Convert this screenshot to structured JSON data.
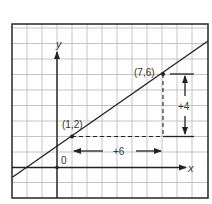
{
  "diagram": {
    "axes": {
      "x_label": "x",
      "y_label": "y",
      "origin_label": "0"
    },
    "points": [
      {
        "label": "(1,2)",
        "x": 1,
        "y": 2
      },
      {
        "label": "(7,6)",
        "x": 7,
        "y": 6
      }
    ],
    "run": {
      "label": "+6",
      "value": 6
    },
    "rise": {
      "label": "+4",
      "value": 4
    },
    "colors": {
      "line": "#222222",
      "grid": "#bdbdbd",
      "border": "#333333",
      "text": "#333333"
    }
  }
}
